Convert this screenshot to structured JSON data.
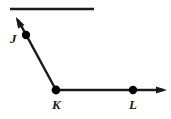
{
  "figure": {
    "type": "geometry-diagram",
    "width": 171,
    "height": 119,
    "background_color": "#ffffff",
    "stroke_color": "#1a1a1a",
    "point_color": "#000000"
  },
  "labels": {
    "j": "J",
    "k": "K",
    "l": "L"
  },
  "points": [
    {
      "name": "J",
      "label": "J",
      "x": 26,
      "y": 35,
      "radius": 4.2,
      "label_x": 10,
      "label_y": 32
    },
    {
      "name": "K",
      "label": "K",
      "x": 56,
      "y": 90,
      "radius": 4.4,
      "label_x": 52,
      "label_y": 98
    },
    {
      "name": "L",
      "label": "L",
      "x": 133,
      "y": 90,
      "radius": 4.2,
      "label_x": 129,
      "label_y": 98
    }
  ],
  "segments": [
    {
      "name": "top-line",
      "x1": 10,
      "y1": 9,
      "x2": 94,
      "y2": 9,
      "stroke_width": 2.6,
      "arrow_start": false,
      "arrow_end": false
    },
    {
      "name": "ray-kj",
      "x1": 56,
      "y1": 90,
      "x2": 17,
      "y2": 18,
      "stroke_width": 2.4,
      "arrow_start": false,
      "arrow_end": true
    },
    {
      "name": "ray-kl",
      "x1": 56,
      "y1": 90,
      "x2": 166,
      "y2": 90,
      "stroke_width": 2.4,
      "arrow_start": false,
      "arrow_end": true
    }
  ],
  "arrowheads": [
    {
      "name": "arrowhead-upper-left",
      "tip_x": 16,
      "tip_y": 17,
      "angle_deg": 241.5,
      "length": 11,
      "half_width": 3.6
    },
    {
      "name": "arrowhead-right",
      "tip_x": 167,
      "tip_y": 90,
      "angle_deg": 0,
      "length": 11,
      "half_width": 3.6
    }
  ]
}
